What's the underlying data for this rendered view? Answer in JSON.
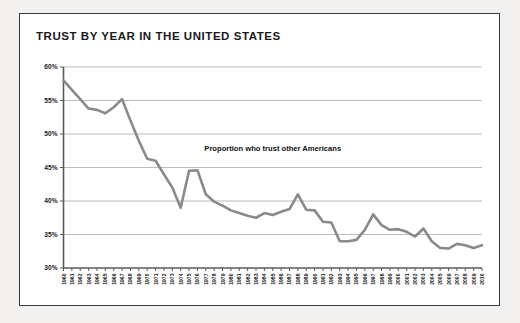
{
  "figure": {
    "title": "TRUST BY YEAR IN THE UNITED STATES",
    "frame_color": "#3a3a3a",
    "background": "#ffffff",
    "page_background": "#f2f1ef"
  },
  "chart_data": {
    "type": "line",
    "title": "TRUST BY YEAR IN THE UNITED STATES",
    "xlabel": "",
    "ylabel": "",
    "ylim": [
      30,
      60
    ],
    "yticks": [
      30,
      35,
      40,
      45,
      50,
      55,
      60
    ],
    "ytick_labels": [
      "30%",
      "35%",
      "40%",
      "45%",
      "50%",
      "55%",
      "60%"
    ],
    "grid": true,
    "legend": "none",
    "line_color": "#8a8a8a",
    "annotations": [
      {
        "text": "Proportion who trust other Americans",
        "x": 1985,
        "y": 47.5
      }
    ],
    "categories": [
      "1960",
      "1961",
      "1962",
      "1963",
      "1964",
      "1965",
      "1966",
      "1967",
      "1968",
      "1969",
      "1970",
      "1971",
      "1972",
      "1973",
      "1974",
      "1975",
      "1976",
      "1977",
      "1978",
      "1979",
      "1980",
      "1981",
      "1982",
      "1983",
      "1984",
      "1985",
      "1986",
      "1987",
      "1988",
      "1989",
      "1990",
      "1991",
      "1992",
      "1993",
      "1994",
      "1995",
      "1996",
      "1997",
      "1998",
      "1999",
      "2000",
      "2001",
      "2002",
      "2003",
      "2004",
      "2005",
      "2006",
      "2007",
      "2008",
      "2009",
      "2010"
    ],
    "x": [
      1960,
      1961,
      1962,
      1963,
      1964,
      1965,
      1966,
      1967,
      1968,
      1969,
      1970,
      1971,
      1972,
      1973,
      1974,
      1975,
      1976,
      1977,
      1978,
      1979,
      1980,
      1981,
      1982,
      1983,
      1984,
      1985,
      1986,
      1987,
      1988,
      1989,
      1990,
      1991,
      1992,
      1993,
      1994,
      1995,
      1996,
      1997,
      1998,
      1999,
      2000,
      2001,
      2002,
      2003,
      2004,
      2005,
      2006,
      2007,
      2008,
      2009,
      2010
    ],
    "values": [
      58.0,
      56.6,
      55.2,
      53.8,
      53.6,
      53.1,
      54.0,
      55.2,
      52.0,
      49.0,
      46.3,
      46.0,
      44.0,
      42.0,
      39.0,
      44.5,
      44.6,
      41.0,
      39.9,
      39.3,
      38.6,
      38.2,
      37.8,
      37.5,
      38.2,
      37.9,
      38.4,
      38.8,
      41.0,
      38.7,
      38.6,
      36.9,
      36.8,
      34.0,
      34.0,
      34.2,
      35.7,
      38.0,
      36.4,
      35.7,
      35.8,
      35.4,
      34.7,
      35.9,
      34.0,
      33.0,
      32.9,
      33.6,
      33.4,
      33.0,
      33.4
    ]
  }
}
